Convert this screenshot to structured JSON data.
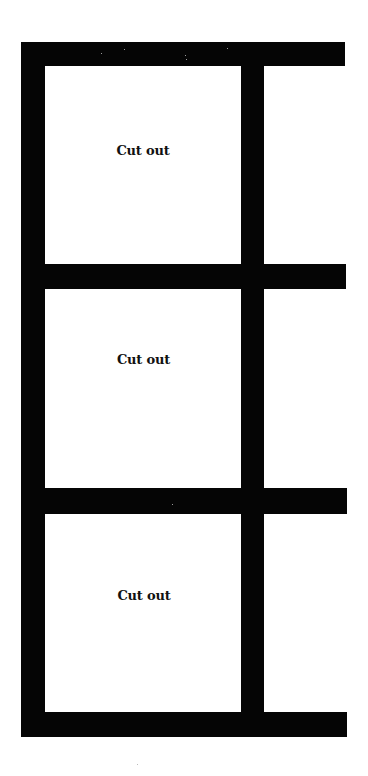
{
  "template": {
    "colors": {
      "frame": "#050505",
      "background": "#ffffff",
      "text": "#111111"
    },
    "cells": [
      {
        "label": "Cut out"
      },
      {
        "label": "Cut out"
      },
      {
        "label": "Cut out"
      }
    ]
  }
}
